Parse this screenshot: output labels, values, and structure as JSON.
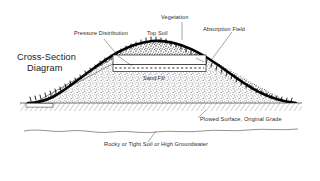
{
  "diagram": {
    "title_line1": "Cross-Section",
    "title_line2": "Diagram",
    "labels": {
      "pressure_distribution": "Pressure Distribution",
      "top_soil": "Top Soil",
      "vegetation": "Vegetation",
      "absorption_field": "Absorption Field",
      "sand_fill": "Sand Fill",
      "plowed_surface": "Plowed Surface, Original Grade",
      "rocky_soil": "Rocky or Tight Soil or High Groundwater"
    },
    "colors": {
      "background": "#ffffff",
      "ink": "#2b2b2b",
      "crust": "#000000",
      "fill_stipple": "#6f6f6f",
      "ground_hatch": "#555555",
      "label_text": "#2b2b2b"
    }
  }
}
